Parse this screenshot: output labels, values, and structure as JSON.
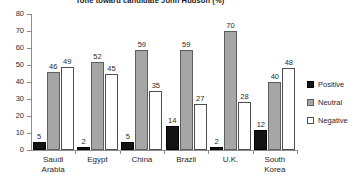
{
  "chart_data": {
    "type": "bar",
    "title": "Tone toward candidate John Hudson (%)",
    "xlabel": "",
    "ylabel": "",
    "ylim": [
      0,
      80
    ],
    "yticks": [
      0,
      10,
      20,
      30,
      40,
      50,
      60,
      70,
      80
    ],
    "grid": false,
    "legend_position": "right",
    "categories": [
      "Saudi Arabia",
      "Egypt",
      "China",
      "Brazil",
      "U.K.",
      "South Korea"
    ],
    "series": [
      {
        "name": "Positive",
        "color": "#131313",
        "values": [
          5,
          2,
          5,
          14,
          2,
          12
        ]
      },
      {
        "name": "Neutral",
        "color": "#a6a6a6",
        "values": [
          46,
          52,
          59,
          59,
          70,
          40
        ]
      },
      {
        "name": "Negative",
        "color": "#ffffff",
        "values": [
          49,
          45,
          35,
          27,
          28,
          48
        ]
      }
    ]
  },
  "axis": {
    "tick_labels": [
      "80",
      "70",
      "60",
      "50",
      "40",
      "30",
      "20",
      "10",
      "0"
    ]
  },
  "category_labels": [
    {
      "line1": "Saudi",
      "line2": "Arabia"
    },
    {
      "line1": "Egypt",
      "line2": ""
    },
    {
      "line1": "China",
      "line2": ""
    },
    {
      "line1": "Brazil",
      "line2": ""
    },
    {
      "line1": "U.K.",
      "line2": ""
    },
    {
      "line1": "South",
      "line2": "Korea"
    }
  ],
  "values_text": {
    "saudi_arabia": [
      "5",
      "46",
      "49"
    ],
    "egypt": [
      "2",
      "52",
      "45"
    ],
    "china": [
      "5",
      "59",
      "35"
    ],
    "brazil": [
      "14",
      "59",
      "27"
    ],
    "uk": [
      "2",
      "70",
      "28"
    ],
    "south_korea": [
      "12",
      "40",
      "48"
    ]
  },
  "legend": {
    "items": [
      {
        "label": "Positive",
        "swatch": "positive-swatch-icon"
      },
      {
        "label": "Neutral",
        "swatch": "neutral-swatch-icon"
      },
      {
        "label": "Negative",
        "swatch": "negative-swatch-icon"
      }
    ]
  }
}
